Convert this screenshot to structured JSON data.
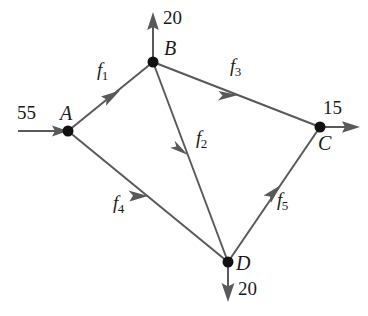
{
  "diagram": {
    "type": "flow-network",
    "stroke_color": "#595959",
    "node_color": "#111111",
    "text_color": "#1a1a1a",
    "background": "#ffffff",
    "nodes": [
      {
        "id": "A",
        "label": "A",
        "x": 68,
        "y": 131,
        "label_x": 60,
        "label_y": 103
      },
      {
        "id": "B",
        "label": "B",
        "x": 153,
        "y": 62,
        "label_x": 164,
        "label_y": 38
      },
      {
        "id": "C",
        "label": "C",
        "x": 320,
        "y": 127,
        "label_x": 318,
        "label_y": 133
      },
      {
        "id": "D",
        "label": "D",
        "x": 228,
        "y": 262,
        "label_x": 236,
        "label_y": 253
      }
    ],
    "edges": [
      {
        "id": "f1",
        "label": "f",
        "subscript": "1",
        "from": "A",
        "to": "B",
        "label_x": 97,
        "label_y": 60
      },
      {
        "id": "f2",
        "label": "f",
        "subscript": "2",
        "from": "B",
        "to": "D",
        "label_x": 196,
        "label_y": 128
      },
      {
        "id": "f3",
        "label": "f",
        "subscript": "3",
        "from": "B",
        "to": "C",
        "label_x": 230,
        "label_y": 56
      },
      {
        "id": "f4",
        "label": "f",
        "subscript": "4",
        "from": "A",
        "to": "D",
        "label_x": 113,
        "label_y": 193
      },
      {
        "id": "f5",
        "label": "f",
        "subscript": "5",
        "from": "D",
        "to": "C",
        "label_x": 277,
        "label_y": 190
      }
    ],
    "external_flows": [
      {
        "id": "inflow-A",
        "value": "55",
        "node": "A",
        "direction": "in-right",
        "label_x": 17,
        "label_y": 103
      },
      {
        "id": "outflow-B",
        "value": "20",
        "node": "B",
        "direction": "out-up",
        "label_x": 163,
        "label_y": 8
      },
      {
        "id": "outflow-C",
        "value": "15",
        "node": "C",
        "direction": "out-right",
        "label_x": 323,
        "label_y": 98
      },
      {
        "id": "outflow-D",
        "value": "20",
        "node": "D",
        "direction": "out-down",
        "label_x": 238,
        "label_y": 279
      }
    ]
  }
}
